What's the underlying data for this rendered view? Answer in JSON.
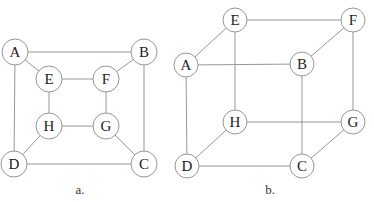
{
  "diagrams": [
    {
      "id": "a",
      "caption": "a.",
      "caption_pos": [
        80,
        194
      ],
      "radius": 13,
      "nodes": [
        {
          "label": "A",
          "x": 15,
          "y": 52
        },
        {
          "label": "B",
          "x": 144,
          "y": 52
        },
        {
          "label": "E",
          "x": 49,
          "y": 79
        },
        {
          "label": "F",
          "x": 106,
          "y": 79
        },
        {
          "label": "H",
          "x": 49,
          "y": 126
        },
        {
          "label": "G",
          "x": 106,
          "y": 126
        },
        {
          "label": "D",
          "x": 14,
          "y": 164
        },
        {
          "label": "C",
          "x": 144,
          "y": 164
        }
      ],
      "edges": [
        [
          "A",
          "B"
        ],
        [
          "A",
          "D"
        ],
        [
          "B",
          "C"
        ],
        [
          "D",
          "C"
        ],
        [
          "A",
          "E"
        ],
        [
          "B",
          "F"
        ],
        [
          "C",
          "G"
        ],
        [
          "D",
          "H"
        ],
        [
          "E",
          "F"
        ],
        [
          "F",
          "G"
        ],
        [
          "G",
          "H"
        ],
        [
          "H",
          "E"
        ]
      ]
    },
    {
      "id": "b",
      "caption": "b.",
      "caption_pos": [
        270,
        194
      ],
      "radius": 12,
      "nodes": [
        {
          "label": "E",
          "x": 235,
          "y": 20
        },
        {
          "label": "F",
          "x": 353,
          "y": 20
        },
        {
          "label": "A",
          "x": 186,
          "y": 65
        },
        {
          "label": "B",
          "x": 302,
          "y": 64
        },
        {
          "label": "H",
          "x": 235,
          "y": 122
        },
        {
          "label": "G",
          "x": 353,
          "y": 122
        },
        {
          "label": "D",
          "x": 187,
          "y": 166
        },
        {
          "label": "C",
          "x": 302,
          "y": 166
        }
      ],
      "edges": [
        [
          "A",
          "B"
        ],
        [
          "A",
          "D"
        ],
        [
          "B",
          "C"
        ],
        [
          "D",
          "C"
        ],
        [
          "A",
          "E"
        ],
        [
          "B",
          "F"
        ],
        [
          "C",
          "G"
        ],
        [
          "D",
          "H"
        ],
        [
          "E",
          "F"
        ],
        [
          "F",
          "G"
        ],
        [
          "G",
          "H"
        ],
        [
          "H",
          "E"
        ]
      ]
    }
  ]
}
